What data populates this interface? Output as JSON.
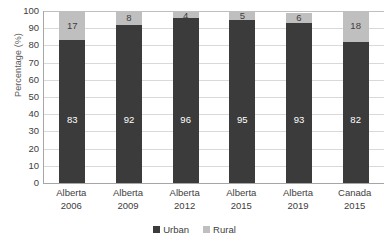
{
  "chart_data": {
    "type": "bar",
    "subtype": "stacked-column-100",
    "title": "",
    "xlabel": "",
    "ylabel": "Percentage (%)",
    "ylim": [
      0,
      100
    ],
    "ytick_step": 10,
    "ytick_labels": [
      "100",
      "90",
      "80",
      "70",
      "60",
      "50",
      "40",
      "30",
      "20",
      "10",
      "0"
    ],
    "grid": true,
    "grid_axis": "y",
    "legend_position": "bottom",
    "categories": [
      {
        "line1": "Alberta",
        "line2": "2006"
      },
      {
        "line1": "Alberta",
        "line2": "2009"
      },
      {
        "line1": "Alberta",
        "line2": "2012"
      },
      {
        "line1": "Alberta",
        "line2": "2015"
      },
      {
        "line1": "Alberta",
        "line2": "2019"
      },
      {
        "line1": "Canada",
        "line2": "2015"
      }
    ],
    "category_labels": [
      "Alberta 2006",
      "Alberta 2009",
      "Alberta 2012",
      "Alberta 2015",
      "Alberta 2019",
      "Canada 2015"
    ],
    "series": [
      {
        "name": "Urban",
        "color": "#3b3b3b",
        "label_color": "#ffffff",
        "values": [
          83,
          92,
          96,
          95,
          93,
          82
        ]
      },
      {
        "name": "Rural",
        "color": "#bfbfbf",
        "label_color": "#404040",
        "values": [
          17,
          8,
          4,
          5,
          6,
          18
        ]
      }
    ]
  },
  "legend": {
    "items": [
      {
        "label": "Urban",
        "color": "#3b3b3b"
      },
      {
        "label": "Rural",
        "color": "#bfbfbf"
      }
    ]
  },
  "axis": {
    "y_title": "Percentage (%)",
    "line_color": "#a6a6a6",
    "grid_color": "#d9d9d9"
  }
}
